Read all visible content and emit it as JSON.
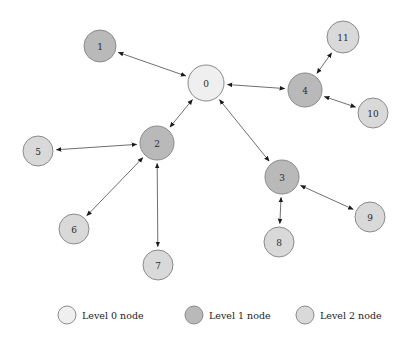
{
  "figure": {
    "type": "node-link-graph",
    "background_color": "#ffffff",
    "width": 406,
    "height": 341
  },
  "colors": {
    "level0_fill": "#efefef",
    "level1_fill": "#b9b9b9",
    "level2_fill": "#d9d9d9",
    "node_stroke": "#8a8a8a",
    "edge_stroke": "#6f6f6f",
    "label_color": "#2b2b2b"
  },
  "graph": {
    "nodes": [
      {
        "id": "0",
        "label": "0",
        "level": 0,
        "x": 206,
        "y": 83,
        "r": 18
      },
      {
        "id": "1",
        "label": "1",
        "level": 1,
        "x": 100,
        "y": 46,
        "r": 16
      },
      {
        "id": "2",
        "label": "2",
        "level": 1,
        "x": 157,
        "y": 143,
        "r": 17
      },
      {
        "id": "3",
        "label": "3",
        "level": 1,
        "x": 282,
        "y": 177,
        "r": 17
      },
      {
        "id": "4",
        "label": "4",
        "level": 1,
        "x": 305,
        "y": 90,
        "r": 17
      },
      {
        "id": "5",
        "label": "5",
        "level": 2,
        "x": 38,
        "y": 151,
        "r": 15
      },
      {
        "id": "6",
        "label": "6",
        "level": 2,
        "x": 74,
        "y": 229,
        "r": 15
      },
      {
        "id": "7",
        "label": "7",
        "level": 2,
        "x": 158,
        "y": 265,
        "r": 15
      },
      {
        "id": "8",
        "label": "8",
        "level": 2,
        "x": 279,
        "y": 242,
        "r": 15
      },
      {
        "id": "9",
        "label": "9",
        "level": 2,
        "x": 370,
        "y": 217,
        "r": 15
      },
      {
        "id": "10",
        "label": "10",
        "level": 2,
        "x": 373,
        "y": 113,
        "r": 15
      },
      {
        "id": "11",
        "label": "11",
        "level": 2,
        "x": 343,
        "y": 37,
        "r": 16
      }
    ],
    "edges": [
      {
        "source": "0",
        "target": "1",
        "directed": "both"
      },
      {
        "source": "0",
        "target": "2",
        "directed": "both"
      },
      {
        "source": "0",
        "target": "3",
        "directed": "both"
      },
      {
        "source": "0",
        "target": "4",
        "directed": "both"
      },
      {
        "source": "2",
        "target": "5",
        "directed": "both"
      },
      {
        "source": "2",
        "target": "6",
        "directed": "both"
      },
      {
        "source": "2",
        "target": "7",
        "directed": "both"
      },
      {
        "source": "3",
        "target": "8",
        "directed": "both"
      },
      {
        "source": "3",
        "target": "9",
        "directed": "both"
      },
      {
        "source": "4",
        "target": "10",
        "directed": "both"
      },
      {
        "source": "4",
        "target": "11",
        "directed": "both"
      }
    ]
  },
  "legend": {
    "items": [
      {
        "label": "Level 0 node",
        "level": 0,
        "swatch_x": 67,
        "swatch_y": 315,
        "text_x": 82,
        "r": 9
      },
      {
        "label": "Level 1 node",
        "level": 1,
        "swatch_x": 194,
        "swatch_y": 315,
        "text_x": 209,
        "r": 9
      },
      {
        "label": "Level 2 node",
        "level": 2,
        "swatch_x": 305,
        "swatch_y": 315,
        "text_x": 320,
        "r": 9
      }
    ]
  }
}
